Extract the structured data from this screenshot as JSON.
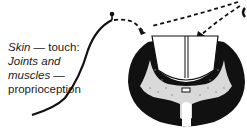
{
  "diagram": {
    "labels": {
      "line1_italic": "Skin",
      "line1_rest": " — touch:",
      "line2": "Joints and",
      "line3": "muscles —",
      "line4": "proprioception"
    },
    "elements": [
      "sensory-nerve-fiber",
      "receptor-ending",
      "dashed-pathway-arrows",
      "spinal-cord-cross-section",
      "dorsal-columns",
      "grey-matter",
      "central-canal"
    ],
    "colors": {
      "ink": "#111111",
      "paper": "#ffffff"
    }
  }
}
